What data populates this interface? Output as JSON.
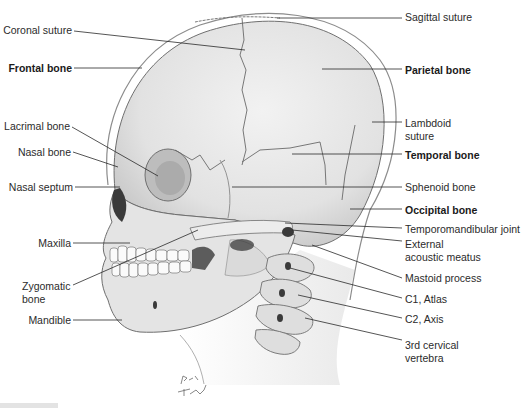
{
  "figure": {
    "artist_signature": "Pat Thomas",
    "colors": {
      "bone": "#e6e6e6",
      "bone_shadow": "#bdbdbd",
      "outline": "#6f6f6f",
      "cavity": "#3a3a3a",
      "leader_line": "#2a2a2a",
      "text": "#2b2b2b"
    }
  },
  "labels": {
    "left": [
      {
        "id": "coronal-suture",
        "line1": "Coronal suture",
        "line2": "",
        "bold": false
      },
      {
        "id": "frontal-bone",
        "line1": "Frontal bone",
        "line2": "",
        "bold": true
      },
      {
        "id": "lacrimal-bone",
        "line1": "Lacrimal bone",
        "line2": "",
        "bold": false
      },
      {
        "id": "nasal-bone",
        "line1": "Nasal bone",
        "line2": "",
        "bold": false
      },
      {
        "id": "nasal-septum",
        "line1": "Nasal septum",
        "line2": "",
        "bold": false
      },
      {
        "id": "maxilla",
        "line1": "Maxilla",
        "line2": "",
        "bold": false
      },
      {
        "id": "zygomatic-bone",
        "line1": "Zygomatic",
        "line2": "bone",
        "bold": false
      },
      {
        "id": "mandible",
        "line1": "Mandible",
        "line2": "",
        "bold": false
      }
    ],
    "right": [
      {
        "id": "sagittal-suture",
        "line1": "Sagittal suture",
        "line2": "",
        "bold": false
      },
      {
        "id": "parietal-bone",
        "line1": "Parietal bone",
        "line2": "",
        "bold": true
      },
      {
        "id": "lambdoid-suture",
        "line1": "Lambdoid",
        "line2": "suture",
        "bold": false
      },
      {
        "id": "temporal-bone",
        "line1": "Temporal bone",
        "line2": "",
        "bold": true
      },
      {
        "id": "sphenoid-bone",
        "line1": "Sphenoid bone",
        "line2": "",
        "bold": false
      },
      {
        "id": "occipital-bone",
        "line1": "Occipital bone",
        "line2": "",
        "bold": true
      },
      {
        "id": "temporomandibular-joint",
        "line1": "Temporomandibular joint",
        "line2": "",
        "bold": false
      },
      {
        "id": "external-acoustic-meatus",
        "line1": "External",
        "line2": "acoustic meatus",
        "bold": false
      },
      {
        "id": "mastoid-process",
        "line1": "Mastoid process",
        "line2": "",
        "bold": false
      },
      {
        "id": "c1-atlas",
        "line1": "C1, Atlas",
        "line2": "",
        "bold": false
      },
      {
        "id": "c2-axis",
        "line1": "C2, Axis",
        "line2": "",
        "bold": false
      },
      {
        "id": "third-cervical-vertebra",
        "line1": "3rd cervical",
        "line2": "vertebra",
        "bold": false
      }
    ]
  }
}
